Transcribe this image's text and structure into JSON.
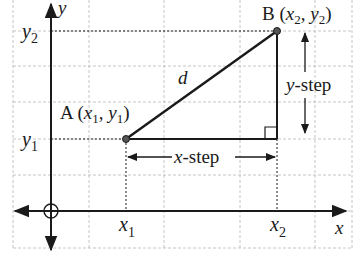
{
  "diagram": {
    "type": "distance-between-two-points",
    "colors": {
      "background": "#ffffff",
      "grid": "#b8b8b8",
      "ink": "#1a1a1a",
      "point_fill": "#555555"
    },
    "axes": {
      "x_label": "x",
      "y_label": "y",
      "origin_marker": "circle-cross"
    },
    "points": {
      "A": {
        "name": "A",
        "coord_label": "(x1, y1)",
        "x_sym": "x",
        "x_sub": "1",
        "y_sym": "y",
        "y_sub": "1"
      },
      "B": {
        "name": "B",
        "coord_label": "(x2, y2)",
        "x_sym": "x",
        "x_sub": "2",
        "y_sym": "y",
        "y_sub": "2"
      }
    },
    "ticks": {
      "x1": {
        "sym": "x",
        "sub": "1"
      },
      "x2": {
        "sym": "x",
        "sub": "2"
      },
      "y1": {
        "sym": "y",
        "sub": "1"
      },
      "y2": {
        "sym": "y",
        "sub": "2"
      }
    },
    "segment_label": "d",
    "x_step": {
      "var": "x",
      "text": "-step"
    },
    "y_step": {
      "var": "y",
      "text": "-step"
    },
    "right_angle_marker": true
  }
}
